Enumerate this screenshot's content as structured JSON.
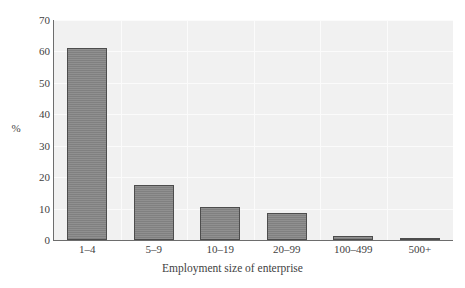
{
  "chart_data": {
    "type": "bar",
    "title": "",
    "subtitle": "",
    "xlabel": "Employment size of enterprise",
    "ylabel": "%",
    "categories": [
      "1–4",
      "5–9",
      "10–19",
      "20–99",
      "100–499",
      "500+"
    ],
    "values": [
      61,
      17.5,
      10.5,
      8.5,
      1.2,
      0.3
    ],
    "ylim": [
      0,
      70
    ],
    "ytick_labels": [
      "0",
      "10",
      "20",
      "30",
      "40",
      "50",
      "60",
      "70"
    ],
    "ytick_values": [
      0,
      10,
      20,
      30,
      40,
      50,
      60,
      70
    ],
    "grid": true,
    "legend": null,
    "legend_position": "none",
    "annotations": [],
    "colors": {
      "bar_fill": "#808080",
      "bar_border": "#4d4d4d",
      "plot_background": "#f1f1f1",
      "gridline": "#fbfbfb",
      "axis": "#6d6d6d",
      "text": "#3f3f3f",
      "page_background": "#ffffff"
    }
  }
}
